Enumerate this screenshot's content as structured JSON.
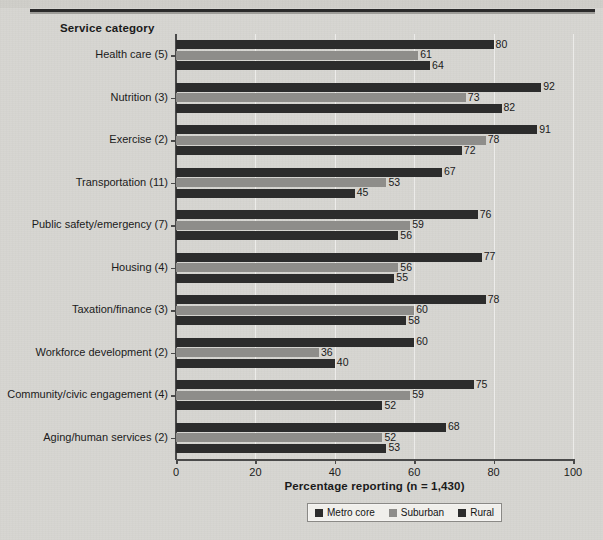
{
  "chart_data": {
    "type": "bar",
    "orientation": "horizontal",
    "title": "",
    "xlabel": "Percentage reporting (n = 1,430)",
    "ylabel": "Service category",
    "xlim": [
      0,
      100
    ],
    "xticks": [
      0,
      20,
      40,
      60,
      80,
      100
    ],
    "grid": "vertical-light",
    "legend_position": "bottom-center",
    "categories": [
      "Health care (5)",
      "Nutrition (3)",
      "Exercise (2)",
      "Transportation (11)",
      "Public safety/emergency (7)",
      "Housing (4)",
      "Taxation/finance (3)",
      "Workforce development (2)",
      "Community/civic engagement (4)",
      "Aging/human services (2)"
    ],
    "series": [
      {
        "name": "Metro core",
        "color": "#2c2c2c",
        "values": [
          80,
          92,
          91,
          67,
          76,
          77,
          78,
          60,
          75,
          68
        ]
      },
      {
        "name": "Suburban",
        "color": "#8e8d8a",
        "values": [
          61,
          73,
          78,
          53,
          59,
          56,
          60,
          36,
          59,
          52
        ]
      },
      {
        "name": "Rural",
        "color": "#2c2c2c",
        "values": [
          64,
          82,
          72,
          45,
          56,
          55,
          58,
          40,
          52,
          53
        ]
      }
    ]
  }
}
